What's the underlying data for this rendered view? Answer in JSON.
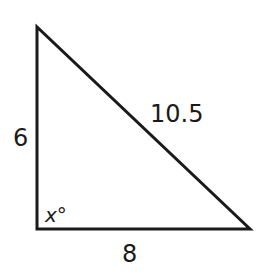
{
  "diagram": {
    "type": "right-triangle",
    "vertices": {
      "top": [
        37,
        27
      ],
      "right_angle": [
        37,
        229
      ],
      "right": [
        250,
        229
      ]
    },
    "labels": {
      "left_side": "6",
      "bottom_side": "8",
      "hypotenuse": "10.5",
      "angle": "x°"
    },
    "colors": {
      "stroke": "#1a1a1a",
      "background": "#ffffff"
    }
  }
}
